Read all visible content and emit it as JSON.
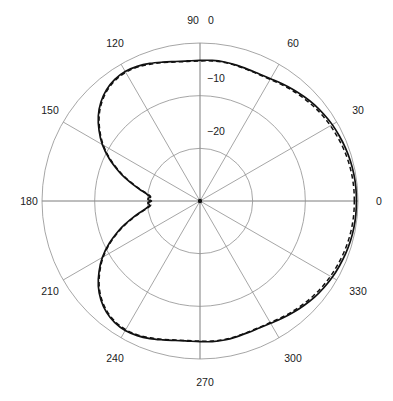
{
  "figure": {
    "background_color": "#ffffff",
    "grid_color": "#8f8f8f",
    "trace_color": "#111111",
    "center_x": 200,
    "center_y": 201,
    "outer_radius": 158
  },
  "chart_data": {
    "type": "line",
    "projection": "polar",
    "title": "",
    "subtitle": "",
    "xlabel": "",
    "ylabel": "",
    "grid": true,
    "legend_position": "none",
    "angle_unit": "degrees",
    "radial_unit": "dB",
    "rlim": [
      -30,
      0
    ],
    "radial_ticks": [
      0,
      -10,
      -20
    ],
    "radial_tick_labels": [
      "0",
      "−10",
      "−20"
    ],
    "radial_tick_axis_angle_deg": 90,
    "angular_ticks": [
      0,
      30,
      60,
      90,
      120,
      150,
      180,
      210,
      240,
      270,
      300,
      330
    ],
    "angular_tick_labels": [
      "0",
      "30",
      "60",
      "90",
      "120",
      "150",
      "180",
      "210",
      "240",
      "270",
      "300",
      "330"
    ],
    "angular_direction": "counterclockwise",
    "angular_zero_location": "E",
    "series": [
      {
        "name": "measured",
        "style": "solid",
        "color": "#111111",
        "theta": [
          0,
          5,
          10,
          15,
          20,
          25,
          30,
          35,
          40,
          45,
          50,
          55,
          60,
          65,
          70,
          75,
          80,
          85,
          90,
          95,
          100,
          105,
          110,
          115,
          120,
          125,
          130,
          135,
          140,
          145,
          150,
          155,
          160,
          163,
          166,
          169,
          172,
          175,
          178,
          180,
          182,
          185,
          188,
          191,
          194,
          197,
          200,
          205,
          210,
          215,
          220,
          225,
          230,
          235,
          240,
          245,
          250,
          255,
          260,
          265,
          270,
          275,
          280,
          285,
          290,
          295,
          300,
          305,
          310,
          315,
          320,
          325,
          330,
          335,
          340,
          345,
          350,
          355,
          360
        ],
        "r_db": [
          -0.3,
          -0.3,
          -0.35,
          -0.45,
          -0.6,
          -0.8,
          -1.0,
          -1.3,
          -1.6,
          -2.0,
          -2.4,
          -2.8,
          -3.2,
          -3.4,
          -3.4,
          -3.3,
          -3.2,
          -3.2,
          -3.3,
          -3.3,
          -3.1,
          -2.7,
          -2.2,
          -1.8,
          -1.6,
          -1.8,
          -2.4,
          -3.4,
          -4.8,
          -6.6,
          -8.6,
          -11.0,
          -13.6,
          -15.2,
          -16.8,
          -18.3,
          -19.6,
          -20.4,
          -20.1,
          -20.6,
          -20.1,
          -20.4,
          -19.6,
          -18.3,
          -16.8,
          -15.2,
          -13.6,
          -11.0,
          -8.6,
          -6.6,
          -4.8,
          -3.4,
          -2.4,
          -1.8,
          -1.6,
          -1.8,
          -2.2,
          -2.7,
          -3.1,
          -3.3,
          -3.3,
          -3.2,
          -3.2,
          -3.3,
          -3.4,
          -3.4,
          -3.2,
          -2.8,
          -2.4,
          -2.0,
          -1.6,
          -1.3,
          -1.0,
          -0.8,
          -0.6,
          -0.45,
          -0.35,
          -0.3,
          -0.3
        ]
      },
      {
        "name": "simulated",
        "style": "dashed",
        "color": "#111111",
        "theta": [
          0,
          5,
          10,
          15,
          20,
          25,
          30,
          35,
          40,
          45,
          50,
          55,
          60,
          65,
          70,
          75,
          80,
          85,
          90,
          95,
          100,
          105,
          110,
          115,
          120,
          125,
          130,
          135,
          140,
          145,
          150,
          155,
          160,
          163,
          166,
          169,
          172,
          175,
          178,
          180,
          182,
          185,
          188,
          191,
          194,
          197,
          200,
          205,
          210,
          215,
          220,
          225,
          230,
          235,
          240,
          245,
          250,
          255,
          260,
          265,
          270,
          275,
          280,
          285,
          290,
          295,
          300,
          305,
          310,
          315,
          320,
          325,
          330,
          335,
          340,
          345,
          350,
          355,
          360
        ],
        "r_db": [
          -0.7,
          -0.7,
          -0.75,
          -0.85,
          -1.0,
          -1.2,
          -1.4,
          -1.65,
          -1.95,
          -2.3,
          -2.65,
          -3.0,
          -3.35,
          -3.5,
          -3.5,
          -3.4,
          -3.3,
          -3.3,
          -3.4,
          -3.4,
          -3.2,
          -2.8,
          -2.35,
          -1.95,
          -1.8,
          -2.0,
          -2.6,
          -3.6,
          -5.0,
          -6.8,
          -8.8,
          -11.2,
          -13.8,
          -15.4,
          -17.0,
          -18.5,
          -19.8,
          -20.6,
          -20.3,
          -20.8,
          -20.3,
          -20.6,
          -19.8,
          -18.5,
          -17.0,
          -15.4,
          -13.8,
          -11.2,
          -8.8,
          -6.8,
          -5.0,
          -3.6,
          -2.6,
          -2.0,
          -1.8,
          -1.95,
          -2.35,
          -2.8,
          -3.2,
          -3.4,
          -3.4,
          -3.3,
          -3.3,
          -3.4,
          -3.5,
          -3.5,
          -3.35,
          -3.0,
          -2.65,
          -2.3,
          -1.95,
          -1.65,
          -1.4,
          -1.2,
          -1.0,
          -0.85,
          -0.75,
          -0.7,
          -0.7
        ]
      }
    ]
  },
  "labels": {
    "angle": {
      "a0": "0",
      "a30": "30",
      "a60": "60",
      "a90": "90",
      "a120": "120",
      "a150": "150",
      "a180": "180",
      "a210": "210",
      "a240": "240",
      "a270": "270",
      "a300": "300",
      "a330": "330"
    },
    "radial": {
      "r0": "0",
      "r10": "−10",
      "r20": "−20"
    }
  }
}
